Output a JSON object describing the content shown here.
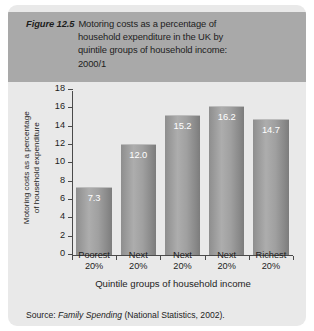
{
  "figure": {
    "number_label": "Figure 12.5",
    "title_lines": [
      "Motoring costs as a percentage of",
      "household expenditure in the UK by",
      "quintile groups of household income:",
      "2000/1"
    ],
    "source_prefix": "Source: ",
    "source_italic": "Family Spending",
    "source_suffix": " (National Statistics, 2002)."
  },
  "chart_data": {
    "type": "bar",
    "title": "Motoring costs as a percentage of household expenditure in the UK by quintile groups of household income: 2000/1",
    "categories": [
      "Poorest 20%",
      "Next 20%",
      "Next 20%",
      "Next 20%",
      "Richest 20%"
    ],
    "category_lines": [
      [
        "Poorest",
        "20%"
      ],
      [
        "Next",
        "20%"
      ],
      [
        "Next",
        "20%"
      ],
      [
        "Next",
        "20%"
      ],
      [
        "Richest",
        "20%"
      ]
    ],
    "values": [
      7.3,
      12.0,
      15.2,
      16.2,
      14.7
    ],
    "value_labels": [
      "7.3",
      "12.0",
      "15.2",
      "16.2",
      "14.7"
    ],
    "xlabel": "Quintile groups of household income",
    "ylabel": "Motoring costs as a percentage of household expenditure",
    "ylabel_lines": [
      "Motoring costs as a percentage",
      "of household expenditure"
    ],
    "ylim": [
      0,
      18
    ],
    "ytick_values": [
      0,
      2,
      4,
      6,
      8,
      10,
      12,
      14,
      16,
      18
    ],
    "ytick_labels": [
      "0",
      "2",
      "4",
      "6",
      "8",
      "10",
      "12",
      "14",
      "16",
      "18"
    ],
    "grid": false,
    "legend": null,
    "colors": {
      "bar_light": "#adadad",
      "bar_dark": "#7c7c7c",
      "axis": "#4a4a4a",
      "plot_background": "#e9e9e9",
      "title_band": "#a9a9a9",
      "value_label": "#ffffff",
      "text": "#1d1d1d"
    }
  }
}
